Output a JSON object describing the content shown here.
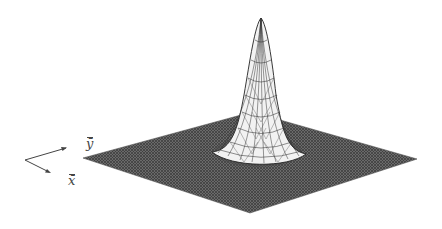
{
  "figure": {
    "type": "3d-surface-mesh",
    "axes": {
      "x_label": "x̄",
      "y_label": "ȳ"
    },
    "colors": {
      "plane": "#5a5a5a",
      "mesh_line": "#222222",
      "peak_fill": "#f4f4f4",
      "background": "#ffffff"
    }
  }
}
